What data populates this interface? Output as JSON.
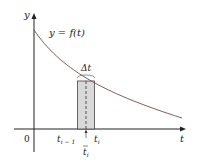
{
  "diagram": {
    "y_axis_label": "y",
    "x_axis_label": "t",
    "origin_label": "0",
    "curve_label": "y = f(t)",
    "delta_label": "Δt",
    "tick_labels": {
      "left": "t",
      "left_sub": "i − 1",
      "right": "t",
      "right_sub": "i",
      "sample": "t",
      "sample_sub": "i"
    },
    "colors": {
      "curve": "#7a4a4a",
      "axis": "#222222",
      "rectangle_fill": "#d9d9d9",
      "rectangle_stroke": "#444444"
    }
  }
}
